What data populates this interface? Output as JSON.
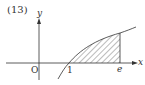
{
  "problem_number": "(13)",
  "axes": {
    "x_label": "x",
    "y_label": "y",
    "origin_label": "O"
  },
  "ticks": {
    "one": "1",
    "e": "e"
  },
  "curve": {
    "function": "y = ln x",
    "shaded_from": "1",
    "shaded_to": "e"
  },
  "colors": {
    "stroke": "#333333",
    "background": "#ffffff"
  }
}
